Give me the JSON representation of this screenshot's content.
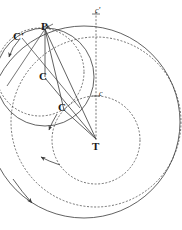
{
  "figure": {
    "background_color": "#ffffff",
    "stroke_color": "#3a3a3a",
    "label_color": "#1a1a1a",
    "width": 182,
    "height": 230
  },
  "labels": [
    {
      "key": "p",
      "text": "P",
      "x": 41,
      "y": 21,
      "style": "bold",
      "name": "point-label-p"
    },
    {
      "key": "c_prime",
      "text": "C'",
      "x": 13,
      "y": 31,
      "style": "bold",
      "name": "point-label-c-prime"
    },
    {
      "key": "c_upper",
      "text": "C",
      "x": 39,
      "y": 71,
      "style": "bold",
      "name": "point-label-c-upper"
    },
    {
      "key": "c_lower",
      "text": "C",
      "x": 58,
      "y": 102,
      "style": "bold",
      "name": "point-label-c-lower"
    },
    {
      "key": "t",
      "text": "T",
      "x": 92,
      "y": 141,
      "style": "bold",
      "name": "point-label-t"
    },
    {
      "key": "c_small_prime",
      "text": "c'",
      "x": 95,
      "y": 7,
      "style": "ital",
      "name": "point-label-c-small-prime"
    },
    {
      "key": "c_small",
      "text": "c",
      "x": 99,
      "y": 90,
      "style": "ital",
      "name": "point-label-c-small"
    }
  ],
  "points": {
    "P": {
      "x": 45,
      "y": 28
    },
    "C": {
      "x": 45,
      "y": 77
    },
    "C2": {
      "x": 63,
      "y": 108
    },
    "T": {
      "x": 96,
      "y": 140
    },
    "c": {
      "x": 96,
      "y": 96
    },
    "c_prime": {
      "x": 96,
      "y": 14
    }
  },
  "circles": [
    {
      "name": "solid-circle-around-c",
      "cx": 45,
      "cy": 77,
      "r": 49,
      "dash": "solid"
    },
    {
      "name": "dashed-circle-through-p",
      "cx": 40,
      "cy": 72,
      "r": 44,
      "dash": "dashed"
    },
    {
      "name": "dashed-inner-circle-around-t",
      "cx": 96,
      "cy": 140,
      "r": 44,
      "dash": "dashed"
    },
    {
      "name": "dashed-outer-circle-around-t",
      "cx": 96,
      "cy": 122,
      "r": 85,
      "dash": "dashed"
    },
    {
      "name": "solid-outer-circle-around-t",
      "cx": 84,
      "cy": 122,
      "r": 96,
      "dash": "solid"
    }
  ],
  "radii": [
    {
      "name": "radius-p-to-c",
      "from": "P",
      "to": "C"
    },
    {
      "name": "radius-p-to-t",
      "from": "P",
      "to": "T"
    },
    {
      "name": "radius-p-to-c2",
      "from": "P",
      "to": "C2"
    },
    {
      "name": "radius-c2-to-t",
      "from": "C2",
      "to": "T"
    },
    {
      "name": "radius-c-to-t",
      "from": "C",
      "to": "T"
    }
  ],
  "axis": {
    "name": "vertical-dashed-axis",
    "x": 96,
    "y_top": 12,
    "y_bottom": 140,
    "dash": "dashed"
  },
  "arrows": [
    {
      "name": "motion-arrow-upper-left",
      "note": "direction of rotation, small epicycle"
    },
    {
      "name": "motion-arrow-middle-left",
      "note": "direction of rotation, mid circle"
    },
    {
      "name": "motion-arrow-lower-inner",
      "note": "direction of rotation, inner deferent"
    },
    {
      "name": "motion-arrow-lower-outer",
      "note": "direction of rotation, outer deferent"
    }
  ]
}
